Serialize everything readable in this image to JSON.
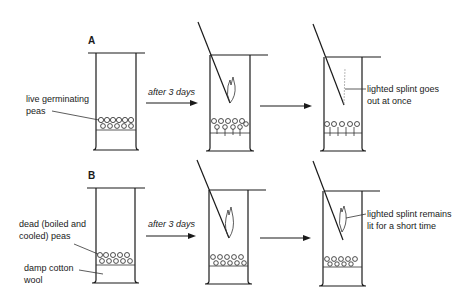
{
  "diagram": {
    "rows": [
      {
        "label": "A",
        "seed_label_line1": "live germinating",
        "seed_label_line2": "peas",
        "arrow_label": "after 3 days",
        "result_line1": "lighted splint goes",
        "result_line2": "out at once"
      },
      {
        "label": "B",
        "seed_label_line1": "dead (boiled and",
        "seed_label_line2": "cooled) peas",
        "cotton_label_line1": "damp cotton",
        "cotton_label_line2": "wool",
        "arrow_label": "after 3 days",
        "result_line1": "lighted splint remains",
        "result_line2": "lit for a short time"
      }
    ]
  }
}
